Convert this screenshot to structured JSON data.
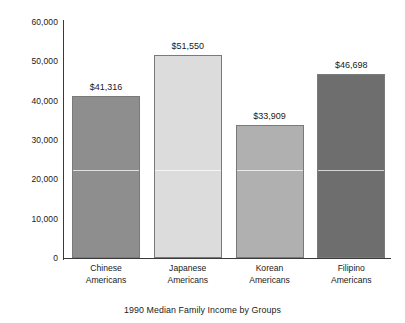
{
  "chart_data": {
    "type": "bar",
    "title": "",
    "caption": "1990 Median Family Income by Groups",
    "xlabel": "",
    "ylabel": "",
    "ylim": [
      0,
      60000
    ],
    "ytick_step": 10000,
    "grid": false,
    "legend": "none",
    "categories": [
      "Chinese Americans",
      "Japanese Americans",
      "Korean Americans",
      "Filipino Americans"
    ],
    "category_lines": [
      [
        "Chinese",
        "Americans"
      ],
      [
        "Japanese",
        "Americans"
      ],
      [
        "Korean",
        "Americans"
      ],
      [
        "Filipino",
        "Americans"
      ]
    ],
    "values": [
      41316,
      51550,
      33909,
      46698
    ],
    "value_labels": [
      "$41,316",
      "$51,550",
      "$33,909",
      "$46,698"
    ],
    "ytick_labels": [
      "60,000",
      "50,000",
      "40,000",
      "30,000",
      "20,000",
      "10,000",
      "0"
    ],
    "ytick_values": [
      60000,
      50000,
      40000,
      30000,
      20000,
      10000,
      0
    ],
    "bar_colors": [
      "#8e8e8e",
      "#dcdcdc",
      "#b0b0b0",
      "#6e6e6e"
    ],
    "bar_border_color": "#7a7a7a",
    "axis_color": "#3a3a3a",
    "background": "#ffffff",
    "text_color": "#1a1a1a"
  }
}
